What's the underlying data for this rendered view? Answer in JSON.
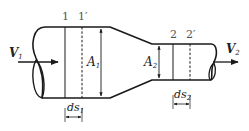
{
  "diagram": {
    "type": "fluid flow through a converging pipe (continuity equation)",
    "colors": {
      "stroke": "#1a1a1a",
      "label": "#222222",
      "section_label": "#555555",
      "background": "#ffffff"
    },
    "sections": {
      "s1": {
        "label": "1"
      },
      "s1p": {
        "label": "1′"
      },
      "s2": {
        "label": "2"
      },
      "s2p": {
        "label": "2′"
      }
    },
    "velocities": {
      "v1": {
        "main": "V",
        "sub": "1"
      },
      "v2": {
        "main": "V",
        "sub": "2"
      }
    },
    "areas": {
      "a1": {
        "main": "A",
        "sub": "1"
      },
      "a2": {
        "main": "A",
        "sub": "2"
      }
    },
    "lengths": {
      "ds1": {
        "main": "ds",
        "sub": "1"
      },
      "ds2": {
        "main": "ds",
        "sub": "2"
      }
    }
  }
}
